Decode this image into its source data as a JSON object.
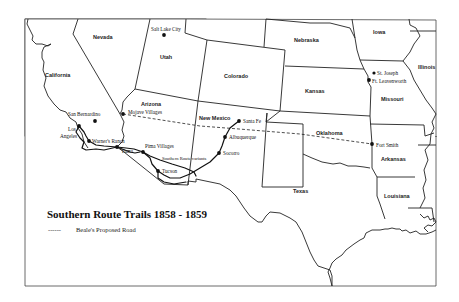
{
  "map": {
    "title": "Southern Route Trails 1858 - 1859",
    "legend": {
      "symbol": "------",
      "label": "Beale's Proposed Road"
    },
    "states": [
      {
        "name": "Nevada",
        "x": 103,
        "y": 38
      },
      {
        "name": "California",
        "x": 57,
        "y": 76
      },
      {
        "name": "Utah",
        "x": 166,
        "y": 58
      },
      {
        "name": "Arizona",
        "x": 152,
        "y": 105
      },
      {
        "name": "Colorado",
        "x": 240,
        "y": 77
      },
      {
        "name": "New Mexico",
        "x": 217,
        "y": 119
      },
      {
        "name": "Nebraska",
        "x": 294,
        "y": 42
      },
      {
        "name": "Kansas",
        "x": 304,
        "y": 92
      },
      {
        "name": "Oklahoma",
        "x": 313,
        "y": 134
      },
      {
        "name": "Texas",
        "x": 301,
        "y": 193
      },
      {
        "name": "Iowa",
        "x": 378,
        "y": 33
      },
      {
        "name": "Illinois",
        "x": 426,
        "y": 68
      },
      {
        "name": "Missouri",
        "x": 396,
        "y": 100
      },
      {
        "name": "Arkansas",
        "x": 396,
        "y": 160
      },
      {
        "name": "Louisiana",
        "x": 396,
        "y": 197
      }
    ],
    "cities": [
      {
        "name": "Salt Lake City",
        "dot_x": 164,
        "dot_y": 35,
        "label_x": 151,
        "label_y": 31
      },
      {
        "name": "San Bernardino",
        "dot_x": 95,
        "dot_y": 121,
        "label_x": 68,
        "label_y": 116
      },
      {
        "name": "Mojave Villages",
        "dot_x": 123,
        "dot_y": 114,
        "label_x": 128,
        "label_y": 114
      },
      {
        "name": "Los",
        "dot_x": 79,
        "dot_y": 126,
        "label_x": 68,
        "label_y": 131
      },
      {
        "name": "Angeles",
        "dot_x": null,
        "dot_y": null,
        "label_x": 60,
        "label_y": 138
      },
      {
        "name": "Warner's Ranch",
        "dot_x": 89,
        "dot_y": 141,
        "label_x": 92,
        "label_y": 143
      },
      {
        "name": "Yuma",
        "dot_x": 117,
        "dot_y": 147,
        "label_x": 121,
        "label_y": 153
      },
      {
        "name": "Pima Villages",
        "dot_x": 143,
        "dot_y": 152,
        "label_x": 145,
        "label_y": 148
      },
      {
        "name": "Southern Route variants",
        "dot_x": null,
        "dot_y": null,
        "label_x": 162,
        "label_y": 160
      },
      {
        "name": "Tucson",
        "dot_x": 158,
        "dot_y": 171,
        "label_x": 162,
        "label_y": 173
      },
      {
        "name": "Santa Fe",
        "dot_x": 239,
        "dot_y": 121,
        "label_x": 243,
        "label_y": 123
      },
      {
        "name": "Albuquerque",
        "dot_x": 225,
        "dot_y": 137,
        "label_x": 229,
        "label_y": 139
      },
      {
        "name": "Socorro",
        "dot_x": 219,
        "dot_y": 153,
        "label_x": 223,
        "label_y": 155
      },
      {
        "name": "St. Joseph",
        "dot_x": 374,
        "dot_y": 73,
        "label_x": 377,
        "label_y": 75
      },
      {
        "name": "Ft. Leavenworth",
        "dot_x": 369,
        "dot_y": 80,
        "label_x": 372,
        "label_y": 83
      },
      {
        "name": "Fort Smith",
        "dot_x": 372,
        "dot_y": 144,
        "label_x": 376,
        "label_y": 147
      }
    ],
    "colors": {
      "ink": "#222222",
      "paper": "#ffffff",
      "frame": "#444444"
    }
  }
}
